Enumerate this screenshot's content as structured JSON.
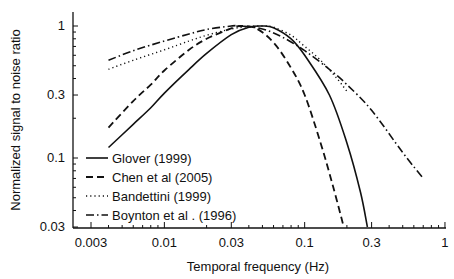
{
  "chart_data": {
    "type": "line",
    "title": "",
    "xlabel": "Temporal frequency (Hz)",
    "ylabel": "Normalized signal to noise ratio",
    "xscale": "log",
    "yscale": "log",
    "xlim": [
      0.003,
      1
    ],
    "ylim": [
      0.03,
      1.1
    ],
    "x_ticks": [
      "0.003",
      "0.01",
      "0.03",
      "0.1",
      "0.3",
      "1"
    ],
    "y_ticks": [
      "0.03",
      "0.1",
      "0.3",
      "1"
    ],
    "grid": false,
    "legend_position": "lower left",
    "series": [
      {
        "name": "Glover (1999)",
        "style": "solid",
        "x": [
          0.004,
          0.006,
          0.008,
          0.01,
          0.015,
          0.02,
          0.03,
          0.04,
          0.05,
          0.06,
          0.08,
          0.1,
          0.15,
          0.2,
          0.25,
          0.28
        ],
        "y": [
          0.12,
          0.18,
          0.24,
          0.31,
          0.47,
          0.62,
          0.86,
          0.98,
          1.0,
          0.97,
          0.8,
          0.6,
          0.3,
          0.13,
          0.055,
          0.03
        ]
      },
      {
        "name": "Chen et al (2005)",
        "style": "dashed",
        "x": [
          0.004,
          0.006,
          0.008,
          0.01,
          0.015,
          0.02,
          0.03,
          0.035,
          0.045,
          0.06,
          0.08,
          0.1,
          0.13,
          0.16,
          0.19
        ],
        "y": [
          0.17,
          0.27,
          0.36,
          0.46,
          0.66,
          0.8,
          0.96,
          1.0,
          0.96,
          0.75,
          0.48,
          0.3,
          0.13,
          0.06,
          0.03
        ]
      },
      {
        "name": "Bandettini (1999)",
        "style": "dotted",
        "x": [
          0.004,
          0.006,
          0.01,
          0.015,
          0.02,
          0.03,
          0.04,
          0.05,
          0.06,
          0.08,
          0.1,
          0.13,
          0.17,
          0.2
        ],
        "y": [
          0.47,
          0.55,
          0.66,
          0.77,
          0.85,
          0.95,
          0.99,
          1.0,
          0.98,
          0.85,
          0.7,
          0.55,
          0.4,
          0.32
        ]
      },
      {
        "name": "Boynton et al . (1996)",
        "style": "dashdot",
        "x": [
          0.004,
          0.006,
          0.01,
          0.015,
          0.02,
          0.03,
          0.035,
          0.05,
          0.07,
          0.1,
          0.15,
          0.2,
          0.3,
          0.5,
          0.7
        ],
        "y": [
          0.55,
          0.65,
          0.77,
          0.87,
          0.94,
          1.0,
          1.0,
          0.95,
          0.82,
          0.65,
          0.47,
          0.36,
          0.23,
          0.11,
          0.07
        ]
      }
    ]
  },
  "legend": {
    "items": [
      {
        "label": "Glover (1999)"
      },
      {
        "label": "Chen et al (2005)"
      },
      {
        "label": "Bandettini (1999)"
      },
      {
        "label": "Boynton et al . (1996)"
      }
    ]
  },
  "axes": {
    "xlabel": "Temporal frequency (Hz)",
    "ylabel": "Normalized signal to noise ratio"
  }
}
